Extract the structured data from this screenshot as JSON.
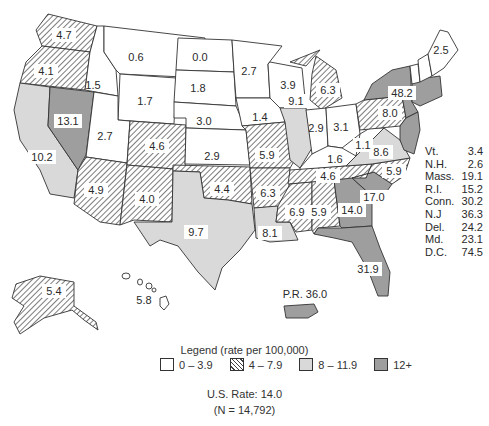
{
  "colors": {
    "low": "#ffffff",
    "mid_hatch": "#444444",
    "high": "#d9d9d9",
    "very_high": "#9e9e9e",
    "outline": "#333333"
  },
  "states": [
    {
      "abbr": "WA",
      "value": "4.7",
      "class": "4-7.9"
    },
    {
      "abbr": "OR",
      "value": "4.1",
      "class": "4-7.9"
    },
    {
      "abbr": "CA",
      "value": "10.2",
      "class": "8-11.9"
    },
    {
      "abbr": "NV",
      "value": "13.1",
      "class": "12+"
    },
    {
      "abbr": "ID",
      "value": "1.5",
      "class": "0-3.9"
    },
    {
      "abbr": "MT",
      "value": "0.6",
      "class": "0-3.9"
    },
    {
      "abbr": "WY",
      "value": "1.7",
      "class": "0-3.9"
    },
    {
      "abbr": "UT",
      "value": "2.7",
      "class": "0-3.9"
    },
    {
      "abbr": "AZ",
      "value": "4.9",
      "class": "4-7.9"
    },
    {
      "abbr": "CO",
      "value": "4.6",
      "class": "4-7.9"
    },
    {
      "abbr": "NM",
      "value": "4.0",
      "class": "4-7.9"
    },
    {
      "abbr": "ND",
      "value": "0.0",
      "class": "0-3.9"
    },
    {
      "abbr": "SD",
      "value": "1.8",
      "class": "0-3.9"
    },
    {
      "abbr": "NE",
      "value": "3.0",
      "class": "0-3.9"
    },
    {
      "abbr": "KS",
      "value": "2.9",
      "class": "0-3.9"
    },
    {
      "abbr": "OK",
      "value": "4.4",
      "class": "4-7.9"
    },
    {
      "abbr": "TX",
      "value": "9.7",
      "class": "8-11.9"
    },
    {
      "abbr": "MN",
      "value": "2.7",
      "class": "0-3.9"
    },
    {
      "abbr": "IA",
      "value": "1.4",
      "class": "0-3.9"
    },
    {
      "abbr": "MO",
      "value": "5.9",
      "class": "4-7.9"
    },
    {
      "abbr": "AR",
      "value": "6.3",
      "class": "4-7.9"
    },
    {
      "abbr": "LA",
      "value": "8.1",
      "class": "8-11.9"
    },
    {
      "abbr": "WI",
      "value": "3.9",
      "class": "0-3.9"
    },
    {
      "abbr": "IL",
      "value": "9.1",
      "class": "8-11.9"
    },
    {
      "abbr": "MI",
      "value": "6.3",
      "class": "4-7.9"
    },
    {
      "abbr": "IN",
      "value": "2.9",
      "class": "0-3.9"
    },
    {
      "abbr": "OH",
      "value": "3.1",
      "class": "0-3.9"
    },
    {
      "abbr": "KY",
      "value": "1.6",
      "class": "0-3.9"
    },
    {
      "abbr": "TN",
      "value": "4.6",
      "class": "4-7.9"
    },
    {
      "abbr": "MS",
      "value": "6.9",
      "class": "4-7.9"
    },
    {
      "abbr": "AL",
      "value": "5.9",
      "class": "4-7.9"
    },
    {
      "abbr": "GA",
      "value": "14.0",
      "class": "12+"
    },
    {
      "abbr": "FL",
      "value": "31.9",
      "class": "12+"
    },
    {
      "abbr": "SC",
      "value": "17.0",
      "class": "12+"
    },
    {
      "abbr": "NC",
      "value": "5.9",
      "class": "4-7.9"
    },
    {
      "abbr": "VA",
      "value": "8.6",
      "class": "8-11.9"
    },
    {
      "abbr": "WV",
      "value": "1.1",
      "class": "0-3.9"
    },
    {
      "abbr": "PA",
      "value": "8.0",
      "class": "4-7.9"
    },
    {
      "abbr": "NY",
      "value": "48.2",
      "class": "12+"
    },
    {
      "abbr": "ME",
      "value": "2.5",
      "class": "0-3.9"
    },
    {
      "abbr": "AK",
      "value": "5.4",
      "class": "4-7.9"
    },
    {
      "abbr": "HI",
      "value": "5.8",
      "class": "0-3.9"
    }
  ],
  "puerto_rico": {
    "label": "P.R. 36.0"
  },
  "side_table": [
    {
      "state": "Vt.",
      "value": "3.4"
    },
    {
      "state": "N.H.",
      "value": "2.6"
    },
    {
      "state": "Mass.",
      "value": "19.1"
    },
    {
      "state": "R.I.",
      "value": "15.2"
    },
    {
      "state": "Conn.",
      "value": "30.2"
    },
    {
      "state": "N.J",
      "value": "36.3"
    },
    {
      "state": "Del.",
      "value": "24.2"
    },
    {
      "state": "Md.",
      "value": "23.1"
    },
    {
      "state": "D.C.",
      "value": "74.5"
    }
  ],
  "legend": {
    "title": "Legend (rate per 100,000)",
    "items": [
      {
        "label": "0 – 3.9",
        "style": "white"
      },
      {
        "label": "4 – 7.9",
        "style": "hatched"
      },
      {
        "label": "8 – 11.9",
        "style": "light-gray"
      },
      {
        "label": "12+",
        "style": "dark-gray"
      }
    ]
  },
  "summary": {
    "us_rate": "U.S. Rate: 14.0",
    "n": "(N = 14,792)"
  }
}
